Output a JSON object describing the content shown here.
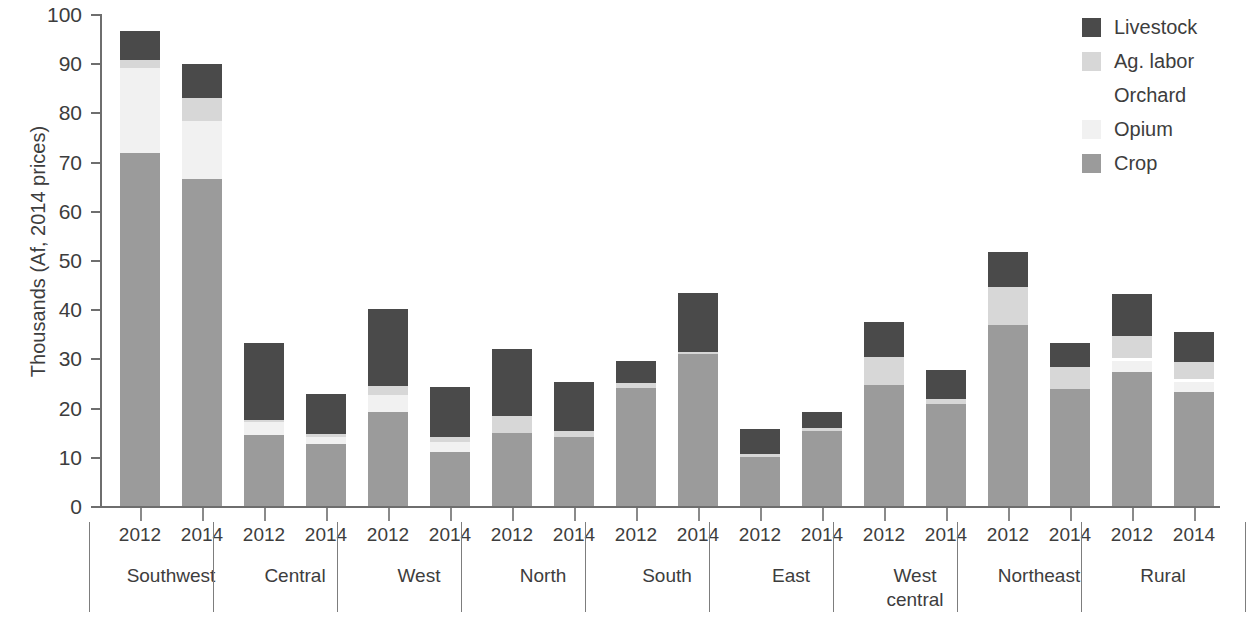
{
  "chart_data": {
    "type": "bar",
    "stacked": true,
    "title": "",
    "xlabel": "",
    "ylabel": "Thousands (Af, 2014 prices)",
    "ylim": [
      0,
      100
    ],
    "yticks": [
      0,
      10,
      20,
      30,
      40,
      50,
      60,
      70,
      80,
      90,
      100
    ],
    "ytick_labels": [
      "0",
      "10",
      "20",
      "30",
      "40",
      "50",
      "60",
      "70",
      "80",
      "90",
      "100"
    ],
    "grid": false,
    "legend_position": "top-right",
    "legend_entries": [
      "Livestock",
      "Ag. labor",
      "Orchard",
      "Opium",
      "Crop"
    ],
    "series_order_bottom_to_top": [
      "Crop",
      "Opium",
      "Orchard",
      "Ag. labor",
      "Livestock"
    ],
    "colors": {
      "Livestock": "#4a4a4a",
      "Ag. labor": "#d7d7d7",
      "Orchard": "#ffffff",
      "Opium": "#f1f1f1",
      "Crop": "#9b9b9b"
    },
    "regions": [
      "Southwest",
      "Central",
      "West",
      "North",
      "South",
      "East",
      "West central",
      "Northeast",
      "Rural"
    ],
    "years": [
      "2012",
      "2014"
    ],
    "series": [
      {
        "name": "Crop",
        "values": [
          72.0,
          66.7,
          14.6,
          12.8,
          19.4,
          11.1,
          15.1,
          14.3,
          24.1,
          31.2,
          10.2,
          15.5,
          24.9,
          20.9,
          36.9,
          24.0,
          27.5,
          23.4
        ]
      },
      {
        "name": "Opium",
        "values": [
          17.2,
          11.8,
          2.6,
          1.4,
          3.4,
          2.1,
          0.0,
          0.0,
          0.0,
          0.0,
          0.0,
          0.0,
          0.0,
          0.0,
          0.0,
          0.0,
          2.2,
          2.1
        ]
      },
      {
        "name": "Orchard",
        "values": [
          0.0,
          0.0,
          0.0,
          0.0,
          0.0,
          0.0,
          0.0,
          0.0,
          0.0,
          0.0,
          0.0,
          0.0,
          0.0,
          0.0,
          0.0,
          0.0,
          0.6,
          0.6
        ]
      },
      {
        "name": "Ag. labor",
        "values": [
          1.6,
          4.6,
          0.5,
          0.6,
          1.8,
          1.1,
          3.3,
          1.1,
          1.1,
          0.4,
          0.5,
          0.6,
          5.6,
          1.0,
          7.9,
          4.4,
          4.4,
          3.3
        ]
      },
      {
        "name": "Livestock",
        "values": [
          6.0,
          6.9,
          15.6,
          8.2,
          15.7,
          10.1,
          13.7,
          10.0,
          4.4,
          11.9,
          5.2,
          3.3,
          7.2,
          5.9,
          7.0,
          5.0,
          8.5,
          6.1
        ]
      }
    ],
    "bars": [
      {
        "region": "Southwest",
        "year": "2012",
        "total": 96.8,
        "segments": {
          "Crop": 72.0,
          "Opium": 17.2,
          "Orchard": 0.0,
          "Ag. labor": 1.6,
          "Livestock": 6.0
        }
      },
      {
        "region": "Southwest",
        "year": "2014",
        "total": 100.0,
        "segments": {
          "Crop": 66.7,
          "Opium": 11.8,
          "Orchard": 0.0,
          "Ag. labor": 4.6,
          "Livestock": 6.9
        }
      },
      {
        "region": "Central",
        "year": "2012",
        "total": 33.3,
        "segments": {
          "Crop": 14.6,
          "Opium": 2.6,
          "Orchard": 0.0,
          "Ag. labor": 0.5,
          "Livestock": 15.6
        }
      },
      {
        "region": "Central",
        "year": "2014",
        "total": 23.0,
        "segments": {
          "Crop": 12.8,
          "Opium": 1.4,
          "Orchard": 0.0,
          "Ag. labor": 0.6,
          "Livestock": 8.2
        }
      },
      {
        "region": "West",
        "year": "2012",
        "total": 40.3,
        "segments": {
          "Crop": 19.4,
          "Opium": 3.4,
          "Orchard": 0.0,
          "Ag. labor": 1.8,
          "Livestock": 15.7
        }
      },
      {
        "region": "West",
        "year": "2014",
        "total": 24.4,
        "segments": {
          "Crop": 11.1,
          "Opium": 2.1,
          "Orchard": 0.0,
          "Ag. labor": 1.1,
          "Livestock": 10.1
        }
      },
      {
        "region": "North",
        "year": "2012",
        "total": 32.1,
        "segments": {
          "Crop": 15.1,
          "Opium": 0.0,
          "Orchard": 0.0,
          "Ag. labor": 3.3,
          "Livestock": 13.7
        }
      },
      {
        "region": "North",
        "year": "2014",
        "total": 25.4,
        "segments": {
          "Crop": 14.3,
          "Opium": 0.0,
          "Orchard": 0.0,
          "Ag. labor": 1.1,
          "Livestock": 10.0
        }
      },
      {
        "region": "South",
        "year": "2012",
        "total": 29.6,
        "segments": {
          "Crop": 24.1,
          "Opium": 0.0,
          "Orchard": 0.0,
          "Ag. labor": 1.1,
          "Livestock": 4.4
        }
      },
      {
        "region": "South",
        "year": "2014",
        "total": 43.5,
        "segments": {
          "Crop": 31.2,
          "Opium": 0.0,
          "Orchard": 0.0,
          "Ag. labor": 0.4,
          "Livestock": 11.9
        }
      },
      {
        "region": "East",
        "year": "2012",
        "total": 15.9,
        "segments": {
          "Crop": 10.2,
          "Opium": 0.0,
          "Orchard": 0.0,
          "Ag. labor": 0.5,
          "Livestock": 5.2
        }
      },
      {
        "region": "East",
        "year": "2014",
        "total": 19.4,
        "segments": {
          "Crop": 15.5,
          "Opium": 0.0,
          "Orchard": 0.0,
          "Ag. labor": 0.6,
          "Livestock": 3.3
        }
      },
      {
        "region": "West central",
        "year": "2012",
        "total": 37.7,
        "segments": {
          "Crop": 24.9,
          "Opium": 0.0,
          "Orchard": 0.0,
          "Ag. labor": 5.6,
          "Livestock": 7.2
        }
      },
      {
        "region": "West central",
        "year": "2014",
        "total": 27.8,
        "segments": {
          "Crop": 20.9,
          "Opium": 0.0,
          "Orchard": 0.0,
          "Ag. labor": 1.0,
          "Livestock": 5.9
        }
      },
      {
        "region": "Northeast",
        "year": "2012",
        "total": 51.8,
        "segments": {
          "Crop": 36.9,
          "Opium": 0.0,
          "Orchard": 0.0,
          "Ag. labor": 7.9,
          "Livestock": 7.0
        }
      },
      {
        "region": "Northeast",
        "year": "2014",
        "total": 33.4,
        "segments": {
          "Crop": 24.0,
          "Opium": 0.0,
          "Orchard": 0.0,
          "Ag. labor": 4.4,
          "Livestock": 5.0
        }
      },
      {
        "region": "Rural",
        "year": "2012",
        "total": 43.2,
        "segments": {
          "Crop": 27.5,
          "Opium": 2.2,
          "Orchard": 0.6,
          "Ag. labor": 4.4,
          "Livestock": 8.5
        }
      },
      {
        "region": "Rural",
        "year": "2014",
        "total": 35.5,
        "segments": {
          "Crop": 23.4,
          "Opium": 2.1,
          "Orchard": 0.6,
          "Ag. labor": 3.3,
          "Livestock": 6.1
        }
      }
    ]
  },
  "legend": {
    "items": [
      {
        "label": "Livestock",
        "color": "#4a4a4a"
      },
      {
        "label": "Ag. labor",
        "color": "#d7d7d7"
      },
      {
        "label": "Orchard",
        "color": "#ffffff"
      },
      {
        "label": "Opium",
        "color": "#f1f1f1"
      },
      {
        "label": "Crop",
        "color": "#9b9b9b"
      }
    ]
  },
  "axes": {
    "y_title": "Thousands (Af, 2014 prices)"
  }
}
